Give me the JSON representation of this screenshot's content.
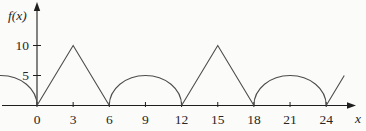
{
  "figure": {
    "background": "#fbfbf9"
  },
  "chart_data": {
    "type": "line",
    "title": "",
    "xlabel": "x",
    "ylabel": "f(x)",
    "x_ticks": [
      0,
      3,
      6,
      9,
      12,
      15,
      18,
      21,
      24
    ],
    "y_ticks": [
      5,
      10
    ],
    "xlim": [
      -3.1,
      26.5
    ],
    "ylim": [
      0,
      12
    ],
    "grid": false,
    "legend": "none",
    "segments": [
      {
        "shape": "semicircle",
        "x_start": -6,
        "x_end": 0,
        "peak": 5
      },
      {
        "shape": "triangle",
        "x_start": 0,
        "x_end": 6,
        "peak": 10
      },
      {
        "shape": "semicircle",
        "x_start": 6,
        "x_end": 12,
        "peak": 5
      },
      {
        "shape": "triangle",
        "x_start": 12,
        "x_end": 18,
        "peak": 10
      },
      {
        "shape": "semicircle",
        "x_start": 18,
        "x_end": 24,
        "peak": 5
      },
      {
        "shape": "partial_rise",
        "x_start": 24,
        "x_end": 25.5,
        "peak": 10,
        "peak_x": 27
      }
    ],
    "colors": {
      "curve": "#4c4c4c",
      "axis": "#1f1f1f",
      "text": "#262626"
    }
  }
}
